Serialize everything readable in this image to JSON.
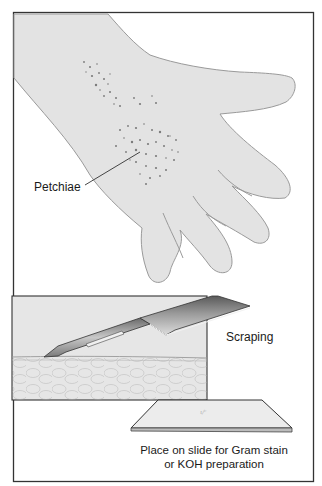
{
  "figure": {
    "labels": {
      "petchiae": "Petchiae",
      "scraping": "Scraping"
    },
    "caption": {
      "line1": "Place on slide for Gram stain",
      "line2": "or KOH preparation"
    },
    "colors": {
      "frame": "#333333",
      "skin_fill": "#e3e3e3",
      "skin_outline": "#9a9a9a",
      "petechiae": "#7a7a7a",
      "tissue_fill": "#e6e6e6",
      "slide_fill": "#ececec",
      "blade_dark": "#3a3a3a",
      "blade_light": "#d8d8d8"
    }
  }
}
